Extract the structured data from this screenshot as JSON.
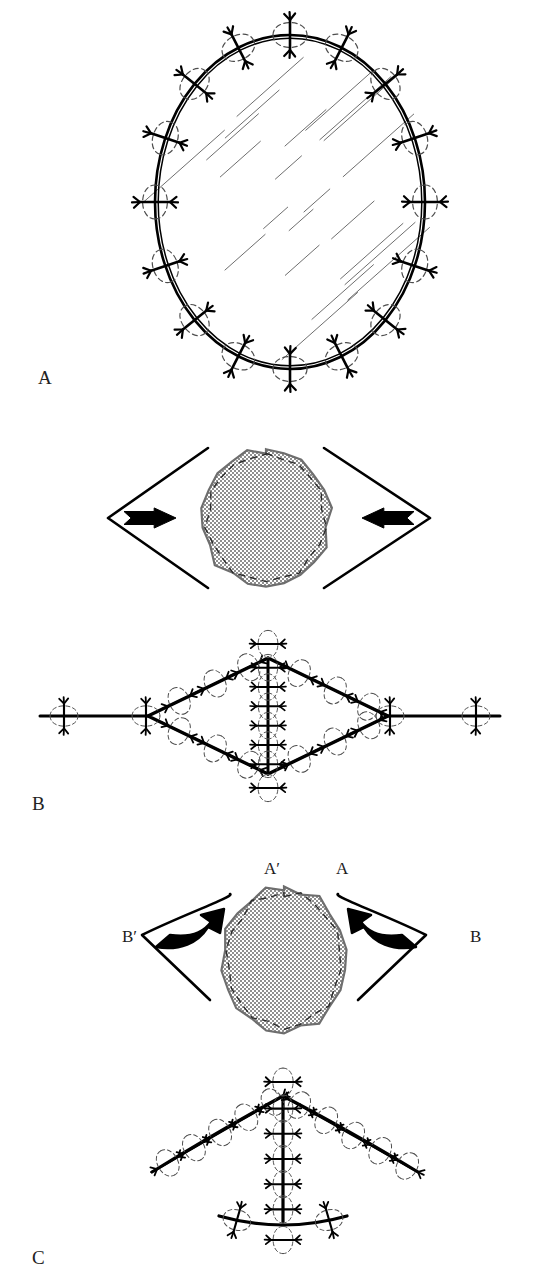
{
  "figure": {
    "background_color": "#ffffff",
    "ink_color": "#000000",
    "stipple_fill_color": "#9a9a9a",
    "dashed_guide_color": "#4d4d4d",
    "width": 533,
    "height": 1288
  },
  "panels": [
    {
      "id": "A",
      "label": "A",
      "caption_position": "bottom-left",
      "description": "Circular wound closed with interrupted sutures placed radially around the entire circumference",
      "suture_count": 16,
      "shape": "circle"
    },
    {
      "id": "B",
      "label": "B",
      "caption_position": "bottom-left",
      "description": "Fusiform (elliptical) excision with opposing arrows showing advancement, and resulting sutured closure",
      "arrows": 2,
      "shape": "fusiform"
    },
    {
      "id": "C",
      "label": "C",
      "caption_position": "bottom-left",
      "description": "Bilateral rotation flaps A-B and A'-B' with curved advancement arrows, and resulting inverted-Y sutured closure",
      "arrows": 2,
      "shape": "bilateral-flap"
    }
  ],
  "vertex_labels": {
    "a_prime": "A′",
    "a": "A",
    "b_prime": "B′",
    "b": "B"
  },
  "panel_labels": {
    "a": "A",
    "b": "B",
    "c": "C"
  },
  "graphics": {
    "panel_a": {
      "circle": {
        "cx": 290,
        "cy": 202,
        "rx": 135,
        "ry": 167
      },
      "suture_count": 16,
      "suture_start_angle_deg": -90,
      "hatch_strokes": 22
    },
    "panel_b_top": {
      "defect": {
        "cx": 266,
        "cy": 518,
        "rx": 64,
        "ry": 68
      },
      "fusiform_left_tip_x": 108,
      "fusiform_right_tip_x": 430,
      "arrow_left": {
        "x": 150,
        "y": 518,
        "direction": "right"
      },
      "arrow_right": {
        "x": 388,
        "y": 518,
        "direction": "left"
      }
    },
    "panel_b_bottom": {
      "center": {
        "x": 268,
        "y": 716
      },
      "diamond_half_width": 120,
      "diamond_half_height": 58,
      "tail_left_x": 40,
      "tail_right_x": 500,
      "vertical_sutures": 6
    },
    "panel_c_top": {
      "defect": {
        "cx": 284,
        "cy": 960,
        "rx": 62,
        "ry": 72
      },
      "arrow_left": {
        "x": 190,
        "y": 935,
        "direction": "right-up"
      },
      "arrow_right": {
        "x": 382,
        "y": 935,
        "direction": "left-up"
      }
    },
    "panel_c_bottom": {
      "apex": {
        "x": 283,
        "y": 1096
      },
      "arm_left_end": {
        "x": 152,
        "y": 1172
      },
      "arm_right_end": {
        "x": 418,
        "y": 1172
      },
      "stem_bottom": {
        "x": 283,
        "y": 1222
      },
      "base_half_width": 64,
      "vertical_sutures": 5
    }
  }
}
